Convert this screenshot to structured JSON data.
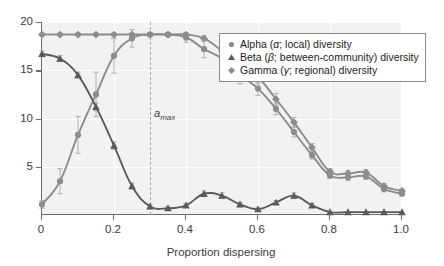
{
  "chart_data": {
    "type": "line",
    "title": "",
    "xlabel": "Proportion dispersing",
    "ylabel": "Species richness",
    "xlim": [
      0,
      1.0
    ],
    "ylim": [
      0,
      20
    ],
    "xticks": [
      "0",
      "0.2",
      "0.4",
      "0.6",
      "0.8",
      "1.0"
    ],
    "xtick_values": [
      0,
      0.2,
      0.4,
      0.6,
      0.8,
      1.0
    ],
    "yticks": [
      "5",
      "10",
      "15",
      "20"
    ],
    "ytick_values": [
      5,
      10,
      15,
      20
    ],
    "grid": true,
    "legend_position": "upper-right",
    "x": [
      0.0,
      0.05,
      0.1,
      0.15,
      0.2,
      0.25,
      0.3,
      0.35,
      0.4,
      0.45,
      0.5,
      0.55,
      0.6,
      0.65,
      0.7,
      0.75,
      0.8,
      0.85,
      0.9,
      0.95,
      1.0
    ],
    "series": [
      {
        "name": "Alpha (α; local) diversity",
        "marker": "circle",
        "color": "#8c8c8c",
        "values": [
          1.1,
          3.5,
          8.3,
          12.5,
          16.5,
          18.3,
          18.7,
          18.7,
          18.4,
          17.2,
          16.2,
          14.5,
          13.1,
          11.0,
          8.6,
          6.2,
          4.1,
          3.9,
          4.0,
          2.7,
          2.2
        ],
        "errors": [
          0.4,
          1.3,
          1.9,
          2.3,
          1.8,
          0.9,
          0.2,
          0.2,
          0.5,
          0.9,
          0.9,
          0.9,
          0.7,
          0.6,
          0.5,
          0.4,
          0.3,
          0.3,
          0.3,
          0.3,
          0.2
        ]
      },
      {
        "name": "Beta (β; between-community) diversity",
        "marker": "triangle",
        "color": "#5a5a5a",
        "values": [
          16.7,
          16.2,
          14.5,
          11.2,
          7.2,
          3.0,
          0.9,
          0.7,
          1.0,
          2.2,
          2.0,
          1.1,
          0.6,
          1.3,
          2.0,
          1.0,
          0.3,
          0.3,
          0.3,
          0.3,
          0.3
        ],
        "errors": [
          0.3,
          0.3,
          0.3,
          0.4,
          0.4,
          0.3,
          0.2,
          0.2,
          0.2,
          0.3,
          0.3,
          0.2,
          0.2,
          0.2,
          0.3,
          0.2,
          0.1,
          0.1,
          0.1,
          0.1,
          0.1
        ]
      },
      {
        "name": "Gamma (γ; regional) diversity",
        "marker": "diamond",
        "color": "#8c8c8c",
        "values": [
          18.7,
          18.7,
          18.7,
          18.7,
          18.7,
          18.7,
          18.7,
          18.7,
          18.7,
          18.3,
          17.0,
          15.6,
          14.3,
          12.0,
          9.6,
          7.0,
          4.5,
          4.3,
          4.4,
          3.0,
          2.5
        ],
        "errors": [
          0.15,
          0.15,
          0.15,
          0.15,
          0.15,
          0.15,
          0.15,
          0.15,
          0.15,
          0.3,
          0.6,
          0.8,
          0.7,
          0.6,
          0.5,
          0.4,
          0.3,
          0.3,
          0.3,
          0.25,
          0.2
        ]
      }
    ],
    "annotations": [
      {
        "name": "a-max",
        "text": "a",
        "subscript": "max",
        "x": 0.3,
        "style": "vertical-dashed-line"
      }
    ]
  },
  "legend": {
    "items": [
      {
        "marker": "circle",
        "label_pre": "Alpha (",
        "symbol": "α",
        "label_post": "; local) diversity"
      },
      {
        "marker": "triangle",
        "label_pre": "Beta (",
        "symbol": "β",
        "label_post": "; between-community) diversity"
      },
      {
        "marker": "diamond",
        "label_pre": "Gamma (",
        "symbol": "γ",
        "label_post": "; regional) diversity"
      }
    ]
  },
  "colors": {
    "plot_background": "#f2f2f2",
    "axis": "#6d6d6d",
    "gridline": "#ffffff",
    "alpha_series": "#8c8c8c",
    "beta_series": "#5a5a5a",
    "gamma_series": "#8c8c8c",
    "amax_line": "#a8a8a8",
    "text": "#3b3b3b"
  }
}
